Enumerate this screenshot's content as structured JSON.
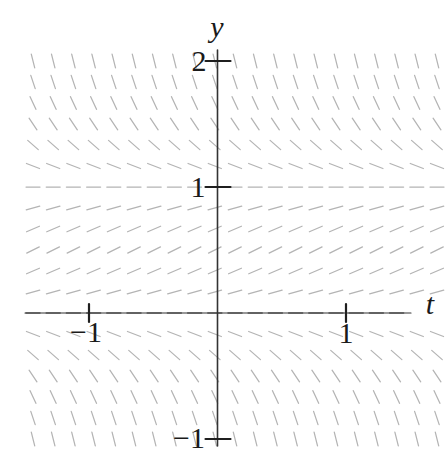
{
  "figure": {
    "background": "#ffffff"
  },
  "chart_data": {
    "type": "slope-field",
    "slope_expr": "2*y*(1-y)",
    "xlabel": "t",
    "ylabel": "y",
    "t_range": [
      -1.5,
      1.75
    ],
    "y_range": [
      -1.2,
      2.05
    ],
    "x_ticks": [
      {
        "value": -1,
        "label": "−1"
      },
      {
        "value": 1,
        "label": "1"
      }
    ],
    "y_ticks": [
      {
        "value": 2,
        "label": "2"
      },
      {
        "value": 1,
        "label": "1"
      },
      {
        "value": -1,
        "label": "−1"
      }
    ],
    "equilibria": [
      0,
      1
    ],
    "grid": {
      "cols": 21,
      "rows": 19
    },
    "style": {
      "segment_color": "#b4b4b4",
      "zero_row_color": "#707070",
      "axis_color": "#333333",
      "tick_color": "#1f1f1f",
      "label_color": "#1a1a1a",
      "segment_length_px": 14
    }
  }
}
